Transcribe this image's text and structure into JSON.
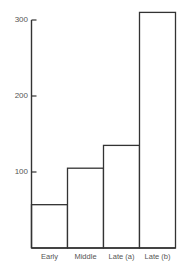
{
  "chart_data": {
    "type": "bar",
    "title": "",
    "xlabel": "",
    "ylabel": "",
    "categories": [
      "Early",
      "Middle",
      "Late (a)",
      "Late (b)"
    ],
    "values": [
      57,
      105,
      135,
      310
    ],
    "yticks": [
      100,
      200,
      300
    ],
    "ytick_labels": [
      "100",
      "200",
      "300"
    ],
    "ylim": [
      0,
      310
    ],
    "grid": false,
    "legend": null,
    "bar_fill": "#ffffff",
    "bar_stroke": "#333333"
  }
}
